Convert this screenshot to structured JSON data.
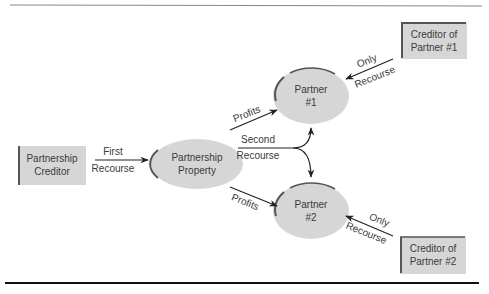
{
  "diagram": {
    "colors": {
      "node_fill": "#d6d6d6",
      "node_shadow": "#555555",
      "line": "#222222",
      "text": "#3a3a3a"
    },
    "nodes": {
      "partnership_creditor": {
        "line1": "Partnership",
        "line2": "Creditor",
        "shape": "box"
      },
      "partnership_property": {
        "line1": "Partnership",
        "line2": "Property",
        "shape": "ellipse"
      },
      "partner1": {
        "line1": "Partner",
        "line2": "#1",
        "shape": "ellipse"
      },
      "partner2": {
        "line1": "Partner",
        "line2": "#2",
        "shape": "ellipse"
      },
      "creditor_partner1": {
        "line1": "Creditor of",
        "line2": "Partner #1",
        "shape": "box"
      },
      "creditor_partner2": {
        "line1": "Creditor of",
        "line2": "Partner #2",
        "shape": "box"
      }
    },
    "edges": {
      "first_recourse": {
        "line1": "First",
        "line2": "Recourse",
        "from": "Partnership Creditor",
        "to": "Partnership Property"
      },
      "profits_to_p1": {
        "label": "Profits",
        "from": "Partnership Property",
        "to": "Partner #1"
      },
      "profits_to_p2": {
        "label": "Profits",
        "from": "Partnership Property",
        "to": "Partner #2"
      },
      "second_recourse": {
        "line1": "Second",
        "line2": "Recourse",
        "from": "Partnership Property",
        "to": [
          "Partner #1",
          "Partner #2"
        ]
      },
      "only_recourse_p1": {
        "line1": "Only",
        "line2": "Recourse",
        "from": "Creditor of Partner #1",
        "to": "Partner #1"
      },
      "only_recourse_p2": {
        "line1": "Only",
        "line2": "Recourse",
        "from": "Creditor of Partner #2",
        "to": "Partner #2"
      }
    }
  }
}
